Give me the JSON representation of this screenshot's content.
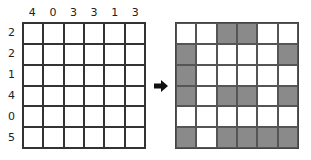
{
  "puzzle": {
    "column_clues": [
      "4",
      "0",
      "3",
      "3",
      "1",
      "3"
    ],
    "row_clues": [
      "2",
      "2",
      "1",
      "4",
      "0",
      "5"
    ],
    "arrow_icon": "right-arrow",
    "solution": [
      [
        0,
        0,
        1,
        1,
        0,
        0
      ],
      [
        1,
        0,
        0,
        0,
        0,
        1
      ],
      [
        1,
        0,
        0,
        0,
        0,
        0
      ],
      [
        1,
        0,
        1,
        1,
        0,
        1
      ],
      [
        0,
        0,
        0,
        0,
        0,
        0
      ],
      [
        1,
        0,
        1,
        1,
        1,
        1
      ]
    ],
    "colors": {
      "filled": "#8a8a8a",
      "empty": "#ffffff",
      "grid_line": "#333333"
    }
  }
}
